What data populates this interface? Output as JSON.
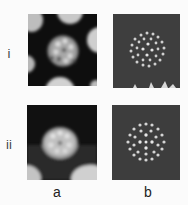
{
  "figure": {
    "row_labels": [
      "i",
      "ii"
    ],
    "column_labels": [
      "a",
      "b"
    ],
    "panels": [
      {
        "id": "i-a",
        "row": "i",
        "column": "a",
        "description": "electron micrograph of a particle showing surface subunits, dark background with neighbouring particles"
      },
      {
        "id": "i-b",
        "row": "i",
        "column": "b",
        "description": "model image: rings of light dots on dark grey background"
      },
      {
        "id": "ii-a",
        "row": "ii",
        "column": "a",
        "description": "electron micrograph of a particle in a different orientation"
      },
      {
        "id": "ii-b",
        "row": "ii",
        "column": "b",
        "description": "model image: array of light dots on dark grey background"
      }
    ]
  },
  "colors": {
    "page_background": "#fbfbfb",
    "micrograph_dark": "#0e0e0e",
    "micrograph_light": "#d8d8d8",
    "model_background": "#3e3e3e",
    "model_dot": "#d4d4d4"
  }
}
